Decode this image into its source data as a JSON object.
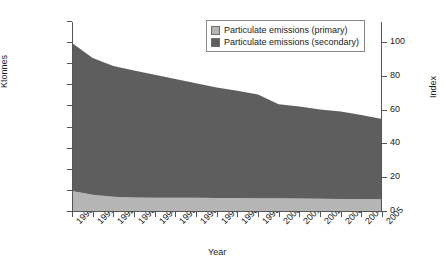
{
  "chart_data": {
    "type": "area",
    "title": "",
    "subtitle": "",
    "xlabel": "Year",
    "ylabel": "Ktonnes",
    "ylabel_secondary": "Index",
    "stacked": true,
    "grid": false,
    "legend_position": "top-right",
    "categories": [
      "1990",
      "1991",
      "1992",
      "1993",
      "1994",
      "1995",
      "1996",
      "1997",
      "1998",
      "1999",
      "2000",
      "2001",
      "2002",
      "2003",
      "2004",
      "2005"
    ],
    "x": [
      1990,
      1991,
      1992,
      1993,
      1994,
      1995,
      1996,
      1997,
      1998,
      1999,
      2000,
      2001,
      2002,
      2003,
      2004,
      2005
    ],
    "ylim": [
      0,
      45000
    ],
    "yticks": [
      0,
      5000,
      10000,
      15000,
      20000,
      25000,
      30000,
      35000,
      40000,
      45000
    ],
    "ytick_labels": [
      "0",
      "5,000",
      "10,000",
      "15,000",
      "20,000",
      "25,000",
      "30,000",
      "35,000",
      "40,000",
      "45,000"
    ],
    "ylim_secondary": [
      0,
      112.5
    ],
    "yticks_secondary": [
      0,
      20,
      40,
      60,
      80,
      100
    ],
    "ytick_labels_secondary": [
      "0",
      "20",
      "40",
      "60",
      "80",
      "100"
    ],
    "series": [
      {
        "name": "Particulate emissions (primary)",
        "color": "#b5b5b5",
        "values": [
          5000,
          4100,
          3600,
          3450,
          3400,
          3350,
          3350,
          3300,
          3300,
          3250,
          3250,
          3200,
          3150,
          3100,
          3050,
          3000
        ]
      },
      {
        "name": "Particulate emissions (secondary)",
        "color": "#5e5e5e",
        "values": [
          35000,
          32400,
          31000,
          30050,
          29100,
          28150,
          27150,
          26200,
          25400,
          24550,
          22250,
          21800,
          21150,
          20700,
          19950,
          19000
        ]
      }
    ],
    "totals": [
      40000,
      36500,
      34600,
      33500,
      32500,
      31500,
      30500,
      29500,
      28700,
      27800,
      25500,
      25000,
      24300,
      23800,
      23000,
      22000
    ]
  },
  "legend": {
    "items": [
      {
        "label": "Particulate emissions (primary)",
        "color": "#b5b5b5"
      },
      {
        "label": "Particulate emissions (secondary)",
        "color": "#5e5e5e"
      }
    ]
  },
  "axes": {
    "left_title": "Ktonnes",
    "right_title": "Index",
    "bottom_title": "Year"
  }
}
